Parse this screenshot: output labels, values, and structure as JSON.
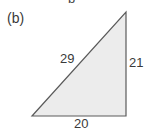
{
  "figure": {
    "panel_label": "(b)",
    "top_cutoff_text": "b",
    "triangle": {
      "type": "right-triangle",
      "hypotenuse_label": "29",
      "vertical_side_label": "21",
      "horizontal_side_label": "20",
      "fill_color": "#ececec",
      "stroke_color": "#555555"
    }
  }
}
